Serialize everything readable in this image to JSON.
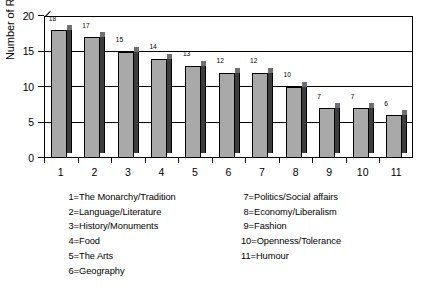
{
  "chart_data": {
    "type": "bar",
    "title": "",
    "xlabel": "",
    "ylabel": "Number of Responses",
    "ylim": [
      0,
      20
    ],
    "yticks": [
      0,
      5,
      10,
      15,
      20
    ],
    "gridlines": [
      5,
      10,
      15
    ],
    "grid": true,
    "legend_position": "below-plot",
    "categories": [
      "1",
      "2",
      "3",
      "4",
      "5",
      "6",
      "7",
      "8",
      "9",
      "10",
      "11"
    ],
    "values": [
      18,
      17,
      15,
      14,
      13,
      12,
      12,
      10,
      7,
      7,
      6
    ],
    "bars": [
      {
        "category": "1",
        "value": 18,
        "label": "18",
        "legend": "The Monarchy/Tradition"
      },
      {
        "category": "2",
        "value": 17,
        "label": "17",
        "legend": "Language/Literature"
      },
      {
        "category": "3",
        "value": 15,
        "label": "15",
        "legend": "History/Monuments"
      },
      {
        "category": "4",
        "value": 14,
        "label": "14",
        "legend": "Food"
      },
      {
        "category": "5",
        "value": 13,
        "label": "13",
        "legend": "The Arts"
      },
      {
        "category": "6",
        "value": 12,
        "label": "12",
        "legend": "Geography"
      },
      {
        "category": "7",
        "value": 12,
        "label": "12",
        "legend": "Politics/Social affairs"
      },
      {
        "category": "8",
        "value": 10,
        "label": "10",
        "legend": "Economy/Liberalism"
      },
      {
        "category": "9",
        "value": 7,
        "label": "7",
        "legend": "Fashion"
      },
      {
        "category": "10",
        "value": 7,
        "label": "7",
        "legend": "Openness/Tolerance"
      },
      {
        "category": "11",
        "value": 6,
        "label": "6",
        "legend": "Humour"
      }
    ],
    "colors": {
      "bar_front": "#a9a9a9",
      "bar_side": "#3d3d3d",
      "bar_top": "#6f6f6f",
      "axis": "#000000",
      "background": "#ffffff"
    }
  },
  "legend": {
    "left_column": [
      {
        "key": "1=",
        "text": "The Monarchy/Tradition"
      },
      {
        "key": "2=",
        "text": "Language/Literature"
      },
      {
        "key": "3=",
        "text": "History/Monuments"
      },
      {
        "key": "4=",
        "text": "Food"
      },
      {
        "key": "5=",
        "text": "The Arts"
      },
      {
        "key": "6=",
        "text": "Geography"
      }
    ],
    "right_column": [
      {
        "key": "7=",
        "text": "Politics/Social affairs"
      },
      {
        "key": "8=",
        "text": "Economy/Liberalism"
      },
      {
        "key": "9=",
        "text": "Fashion"
      },
      {
        "key": "10=",
        "text": "Openness/Tolerance"
      },
      {
        "key": "11=",
        "text": "Humour"
      }
    ]
  }
}
